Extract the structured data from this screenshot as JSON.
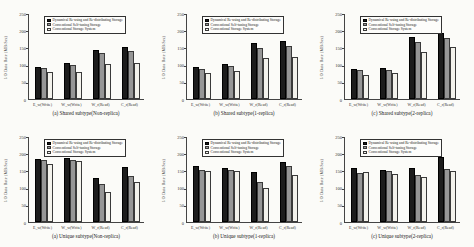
{
  "figure": {
    "background": "#fbfbf8",
    "ylabel": "I/O Data Rate (MB/Sec)",
    "categories": [
      "E_w(Write)",
      "W_w(Write)",
      "W_r(Read)",
      "C_r(Read)"
    ],
    "legend": [
      {
        "label": "Dynamical Re-using and Re-distributing Storage",
        "color": "#1c1c1c",
        "border": "#000000"
      },
      {
        "label": "Conventional Self-tuning Storage",
        "color": "#969696",
        "border": "#3a3a3a"
      },
      {
        "label": "Conventional Storage System",
        "color": "#f3f2ec",
        "border": "#3a3a3a"
      }
    ]
  },
  "chart_data": [
    {
      "type": "bar",
      "title": "(a) Shared subtype(Non-replica)",
      "ylabel": "I/O Data Rate (MB/Sec)",
      "categories": [
        "E_w(Write)",
        "W_w(Write)",
        "W_r(Read)",
        "C_r(Read)"
      ],
      "ylim": [
        0,
        250
      ],
      "yticks": [
        0,
        50,
        100,
        150,
        200,
        250
      ],
      "grid": false,
      "legend_position": "top-left-inside",
      "series": [
        {
          "name": "Dynamical Re-using and Re-distributing Storage",
          "values": [
            93,
            104,
            143,
            152
          ]
        },
        {
          "name": "Conventional Self-tuning Storage",
          "values": [
            91,
            99,
            133,
            139
          ]
        },
        {
          "name": "Conventional Storage System",
          "values": [
            78,
            78,
            103,
            106
          ]
        }
      ]
    },
    {
      "type": "bar",
      "title": "(b) Shared subtype(1-replica)",
      "ylabel": "I/O Data Rate (MB/Sec)",
      "categories": [
        "E_w(Write)",
        "W_w(Write)",
        "W_r(Read)",
        "C_r(Read)"
      ],
      "ylim": [
        0,
        250
      ],
      "yticks": [
        0,
        50,
        100,
        150,
        200,
        250
      ],
      "grid": false,
      "legend_position": "top-left-inside",
      "series": [
        {
          "name": "Dynamical Re-using and Re-distributing Storage",
          "values": [
            92,
            102,
            163,
            170
          ]
        },
        {
          "name": "Conventional Self-tuning Storage",
          "values": [
            88,
            95,
            148,
            153
          ]
        },
        {
          "name": "Conventional Storage System",
          "values": [
            76,
            80,
            118,
            123
          ]
        }
      ]
    },
    {
      "type": "bar",
      "title": "(c) Shared subtype(2-replica)",
      "ylabel": "I/O Data Rate (MB/Sec)",
      "categories": [
        "E_w(Write)",
        "W_w(Write)",
        "W_r(Read)",
        "C_r(Read)"
      ],
      "ylim": [
        0,
        250
      ],
      "yticks": [
        0,
        50,
        100,
        150,
        200,
        250
      ],
      "grid": false,
      "legend_position": "top-left-inside",
      "series": [
        {
          "name": "Dynamical Re-using and Re-distributing Storage",
          "values": [
            87,
            89,
            180,
            191
          ]
        },
        {
          "name": "Conventional Self-tuning Storage",
          "values": [
            83,
            85,
            166,
            176
          ]
        },
        {
          "name": "Conventional Storage System",
          "values": [
            71,
            76,
            137,
            152
          ]
        }
      ]
    },
    {
      "type": "bar",
      "title": "(a) Unique subtype(Non-replica)",
      "ylabel": "I/O Data Rate (MB/Sec)",
      "categories": [
        "E_w(Write)",
        "W_w(Write)",
        "W_r(Read)",
        "C_r(Read)"
      ],
      "ylim": [
        0,
        250
      ],
      "yticks": [
        0,
        50,
        100,
        150,
        200,
        250
      ],
      "grid": false,
      "legend_position": "top-left-inside",
      "series": [
        {
          "name": "Dynamical Re-using and Re-distributing Storage",
          "values": [
            184,
            186,
            128,
            160
          ]
        },
        {
          "name": "Conventional Self-tuning Storage",
          "values": [
            181,
            181,
            110,
            133
          ]
        },
        {
          "name": "Conventional Storage System",
          "values": [
            170,
            176,
            87,
            116
          ]
        }
      ]
    },
    {
      "type": "bar",
      "title": "(b) Unique subtype(1-replica)",
      "ylabel": "I/O Data Rate (MB/Sec)",
      "categories": [
        "E_w(Write)",
        "W_w(Write)",
        "W_r(Read)",
        "C_r(Read)"
      ],
      "ylim": [
        0,
        250
      ],
      "yticks": [
        0,
        50,
        100,
        150,
        200,
        250
      ],
      "grid": false,
      "legend_position": "top-left-inside",
      "series": [
        {
          "name": "Dynamical Re-using and Re-distributing Storage",
          "values": [
            163,
            158,
            146,
            175
          ]
        },
        {
          "name": "Conventional Self-tuning Storage",
          "values": [
            150,
            150,
            117,
            162
          ]
        },
        {
          "name": "Conventional Storage System",
          "values": [
            149,
            148,
            100,
            137
          ]
        }
      ]
    },
    {
      "type": "bar",
      "title": "(c) Unique subtype(2-replica)",
      "ylabel": "I/O Data Rate (MB/Sec)",
      "categories": [
        "E_w(Write)",
        "W_w(Write)",
        "W_r(Read)",
        "C_r(Read)"
      ],
      "ylim": [
        0,
        250
      ],
      "yticks": [
        0,
        50,
        100,
        150,
        200,
        250
      ],
      "grid": false,
      "legend_position": "top-left-inside",
      "series": [
        {
          "name": "Dynamical Re-using and Re-distributing Storage",
          "values": [
            158,
            152,
            157,
            188
          ]
        },
        {
          "name": "Conventional Self-tuning Storage",
          "values": [
            143,
            148,
            138,
            153
          ]
        },
        {
          "name": "Conventional Storage System",
          "values": [
            144,
            139,
            131,
            147
          ]
        }
      ]
    }
  ]
}
